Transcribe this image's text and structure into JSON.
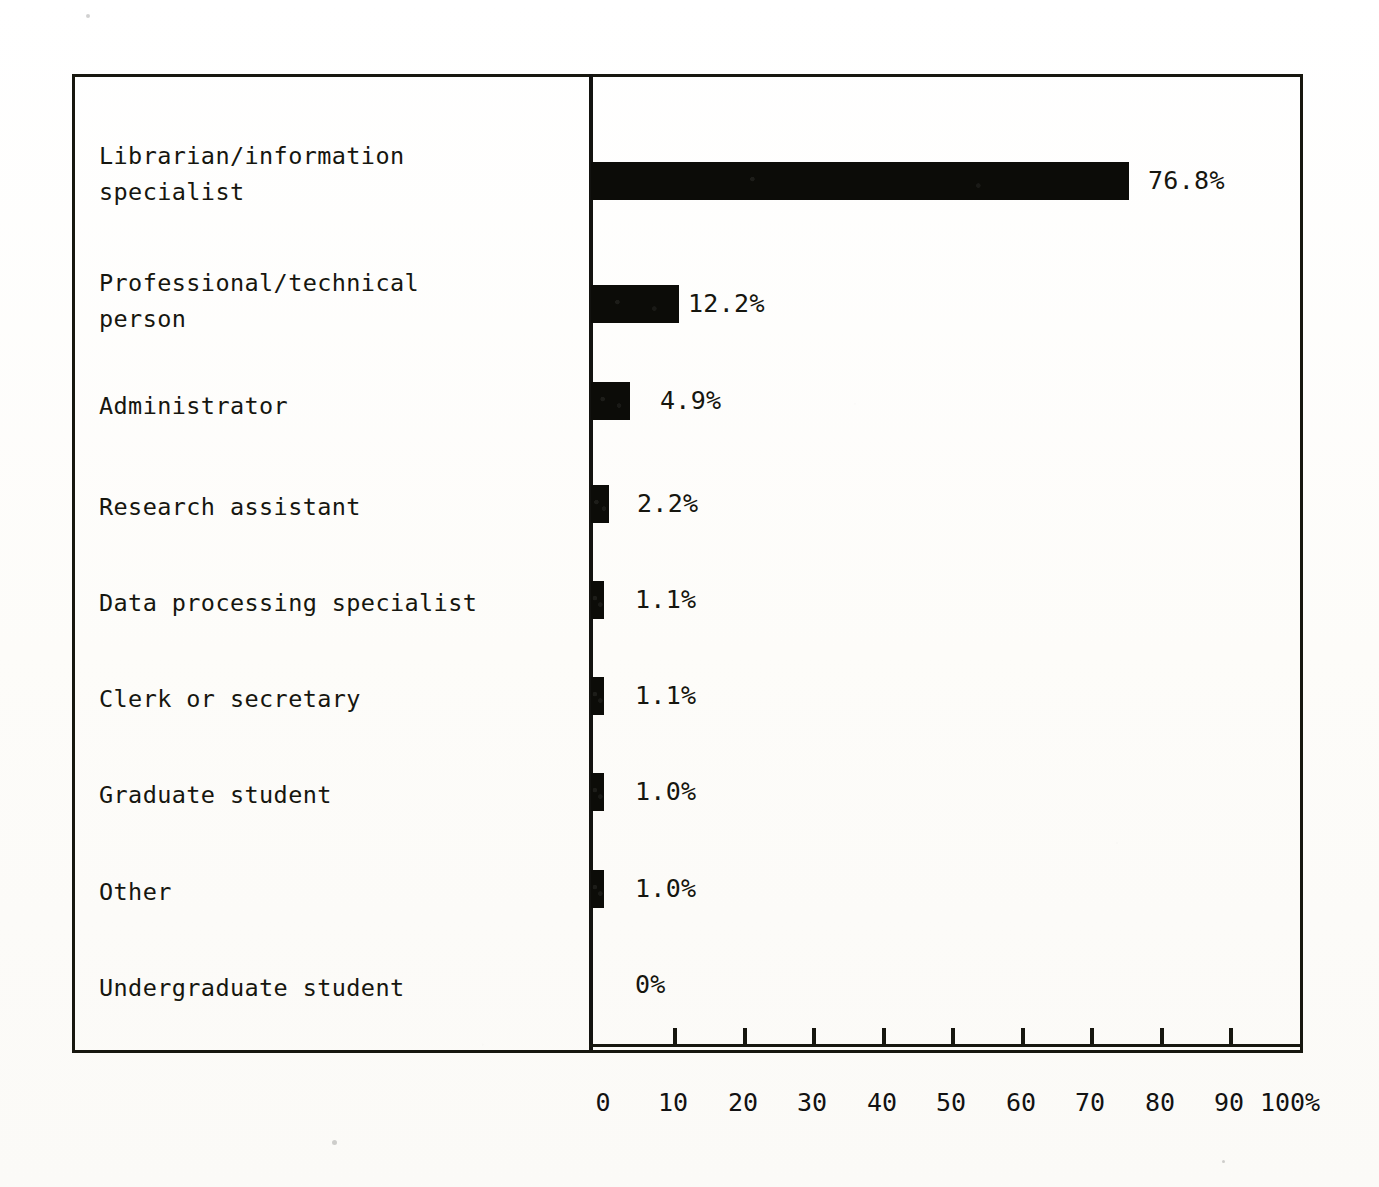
{
  "chart_data": {
    "type": "bar",
    "orientation": "horizontal",
    "title": "",
    "subtitle": "",
    "xlabel": "",
    "ylabel": "",
    "xlim": [
      0,
      100
    ],
    "grid": false,
    "legend": null,
    "bar_color": "#0c0c08",
    "background_color": "#fdfdfb",
    "axis_tick_labels": [
      "0",
      "10",
      "20",
      "30",
      "40",
      "50",
      "60",
      "70",
      "80",
      "90",
      "100%"
    ],
    "axis_tick_values": [
      0,
      10,
      20,
      30,
      40,
      50,
      60,
      70,
      80,
      90,
      100
    ],
    "categories": [
      "Librarian/information\nspecialist",
      "Professional/technical\nperson",
      "Administrator",
      "Research assistant",
      "Data processing specialist",
      "Clerk or secretary",
      "Graduate student",
      "Other",
      "Undergraduate student"
    ],
    "values": [
      76.8,
      12.2,
      4.9,
      2.2,
      1.1,
      1.1,
      1.0,
      1.0,
      0
    ],
    "value_labels": [
      "76.8%",
      "12.2%",
      "4.9%",
      "2.2%",
      "1.1%",
      "1.1%",
      "1.0%",
      "1.0%",
      "0%"
    ]
  },
  "layout": {
    "rows": [
      {
        "label_top": 138,
        "bar_top": 162,
        "bar_width": 538,
        "value_left": 1148
      },
      {
        "label_top": 265,
        "bar_top": 285,
        "bar_width": 88,
        "value_left": 688
      },
      {
        "label_top": 388,
        "bar_top": 382,
        "bar_width": 39,
        "value_left": 660
      },
      {
        "label_top": 489,
        "bar_top": 485,
        "bar_width": 18,
        "value_left": 637
      },
      {
        "label_top": 585,
        "bar_top": 581,
        "bar_width": 13,
        "value_left": 635
      },
      {
        "label_top": 681,
        "bar_top": 677,
        "bar_width": 13,
        "value_left": 635
      },
      {
        "label_top": 777,
        "bar_top": 773,
        "bar_width": 13,
        "value_left": 635
      },
      {
        "label_top": 874,
        "bar_top": 870,
        "bar_width": 13,
        "value_left": 635
      },
      {
        "label_top": 970,
        "bar_top": 966,
        "bar_width": 0,
        "value_left": 635
      }
    ],
    "tick_x": [
      673,
      743,
      812,
      882,
      951,
      1021,
      1090,
      1160,
      1229
    ],
    "tick_label_x": [
      603,
      673,
      743,
      812,
      882,
      951,
      1021,
      1090,
      1160,
      1229,
      1290
    ]
  }
}
